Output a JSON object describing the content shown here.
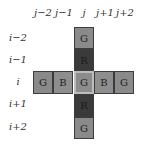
{
  "columns": {
    "labels": [
      "j−2",
      "j−1",
      "j",
      "j+1",
      "j+2"
    ]
  },
  "rows": {
    "labels": [
      "i−2",
      "i−1",
      "i",
      "i+1",
      "i+2"
    ]
  },
  "cells": {
    "r0": "G",
    "r1": "R",
    "c0": "G",
    "c1": "B",
    "center": "G",
    "c3": "B",
    "c4": "G",
    "r3": "R",
    "r4": "G"
  },
  "colors": {
    "G": "#8a8a8a",
    "B": "#8e8e8e",
    "R": "#3a3a3a",
    "center_border": "#bdbdbd",
    "cell_border": "#3c3c3c"
  }
}
